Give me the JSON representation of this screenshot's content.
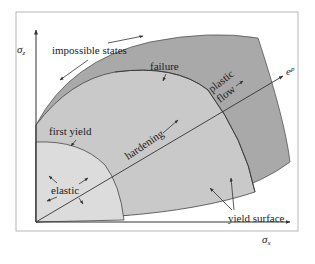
{
  "diagram": {
    "axes": {
      "y_label": "σz",
      "y_symbol": "σ",
      "y_sub": "z",
      "x_label": "σx",
      "x_symbol": "σ",
      "x_sub": "x",
      "strain_label": "ep",
      "strain_symbol": "e",
      "strain_sup": "p"
    },
    "regions": [
      {
        "name": "elastic",
        "color": "#dcdcdc"
      },
      {
        "name": "hardening",
        "color": "#c9c9c9"
      },
      {
        "name": "plastic flow",
        "color": "#a9a9a9"
      },
      {
        "name": "impossible states",
        "color": "#ffffff"
      }
    ],
    "labels": {
      "impossible_states": "impossible states",
      "failure": "failure",
      "plastic": "plastic",
      "flow": "flow",
      "first_yield": "first yield",
      "hardening": "hardening",
      "elastic": "elastic",
      "yield_surface": "yield surface"
    },
    "colors": {
      "frame": "#b8b8b8",
      "line": "#333333"
    }
  }
}
